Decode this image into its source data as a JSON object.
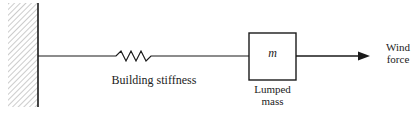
{
  "diagram": {
    "type": "single-degree-of-freedom building model",
    "elements": {
      "wall": {
        "label": "",
        "kind": "fixed-support"
      },
      "spring": {
        "label": "Building stiffness"
      },
      "mass": {
        "symbol": "m",
        "label_line1": "Lumped",
        "label_line2": "mass"
      },
      "force": {
        "label_line1": "Wind",
        "label_line2": "force"
      }
    },
    "colors": {
      "stroke": "#1a1a1a",
      "hatch": "#9a9a9a"
    }
  }
}
